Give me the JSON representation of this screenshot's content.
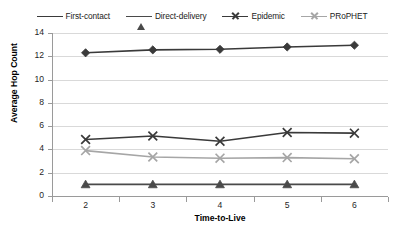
{
  "chart_data": {
    "type": "line",
    "title": "",
    "xlabel": "Time-to-Live",
    "ylabel": "Average Hop Count",
    "categories": [
      "2",
      "3",
      "4",
      "5",
      "6"
    ],
    "x": [
      2,
      3,
      4,
      5,
      6
    ],
    "ylim": [
      0,
      14
    ],
    "yticks": [
      "0",
      "2",
      "4",
      "6",
      "8",
      "10",
      "12",
      "14"
    ],
    "grid": "horizontal",
    "legend_position": "top-center",
    "series": [
      {
        "name": "First-contact",
        "marker": "diamond",
        "color": "#3a3a3a",
        "values": [
          12.3,
          12.55,
          12.6,
          12.8,
          12.95
        ]
      },
      {
        "name": "Direct-delivery",
        "marker": "triangle",
        "color": "#4a4a4a",
        "values": [
          1.0,
          1.0,
          1.0,
          1.0,
          1.0
        ]
      },
      {
        "name": "Epidemic",
        "marker": "x",
        "color": "#3a3a3a",
        "values": [
          4.85,
          5.15,
          4.7,
          5.45,
          5.4
        ]
      },
      {
        "name": "PRoPHET",
        "marker": "x",
        "color": "#a6a6a6",
        "values": [
          3.9,
          3.35,
          3.25,
          3.3,
          3.2
        ]
      }
    ]
  },
  "legend": {
    "items": [
      {
        "label": "First-contact"
      },
      {
        "label": "Direct-delivery"
      },
      {
        "label": "Epidemic"
      },
      {
        "label": "PRoPHET"
      }
    ]
  },
  "axes": {
    "y_title": "Average Hop Count",
    "x_title": "Time-to-Live",
    "y_ticks": [
      "14",
      "12",
      "10",
      "8",
      "6",
      "4",
      "2",
      "0"
    ],
    "x_ticks": [
      "2",
      "3",
      "4",
      "5",
      "6"
    ]
  }
}
